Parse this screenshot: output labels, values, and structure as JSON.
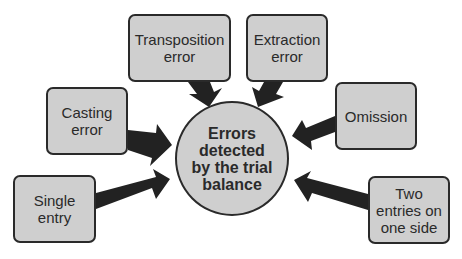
{
  "diagram": {
    "center": {
      "label": "Errors\ndetected\nby the trial\nbalance"
    },
    "nodes": [
      {
        "id": "transposition",
        "label": "Transposition\nerror"
      },
      {
        "id": "extraction",
        "label": "Extraction\nerror"
      },
      {
        "id": "casting",
        "label": "Casting\nerror"
      },
      {
        "id": "omission",
        "label": "Omission"
      },
      {
        "id": "single",
        "label": "Single\nentry"
      },
      {
        "id": "two",
        "label": "Two\nentries on\none side"
      }
    ],
    "edges": [
      {
        "from": "transposition",
        "to": "center"
      },
      {
        "from": "extraction",
        "to": "center"
      },
      {
        "from": "casting",
        "to": "center"
      },
      {
        "from": "omission",
        "to": "center"
      },
      {
        "from": "single",
        "to": "center"
      },
      {
        "from": "two",
        "to": "center"
      }
    ],
    "colors": {
      "fill": "#cfcfcf",
      "stroke": "#2a2a2a",
      "arrow": "#222222"
    }
  }
}
